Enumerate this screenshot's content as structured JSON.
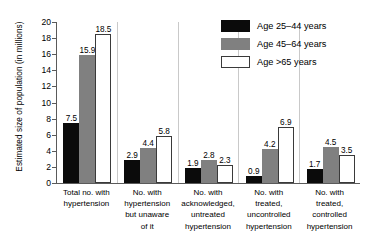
{
  "chart_data": {
    "type": "bar",
    "title": "",
    "subtitle": "",
    "xlabel": "",
    "ylabel": "Estimated size of population (in millions)",
    "ylim": [
      0,
      20
    ],
    "ytick_step": 2,
    "yticks": [
      "20",
      "18",
      "16",
      "14",
      "12",
      "10",
      "8",
      "6",
      "4",
      "2",
      "0"
    ],
    "grid": false,
    "legend_position": "top-right",
    "categories": [
      "Total no. with hypertension",
      "No. with hypertension but unaware of it",
      "No. with acknowledged, untreated hypertension",
      "No. with treated, uncontrolled hypertension",
      "No. with treated, controlled hypertension"
    ],
    "category_lines": [
      [
        "Total no. with",
        "hypertension"
      ],
      [
        "No. with",
        "hypertension",
        "but unaware",
        "of it"
      ],
      [
        "No. with",
        "acknowledged,",
        "untreated",
        "hypertension"
      ],
      [
        "No. with",
        "treated,",
        "uncontrolled",
        "hypertension"
      ],
      [
        "No. with",
        "treated,",
        "controlled",
        "hypertension"
      ]
    ],
    "series": [
      {
        "name": "Age 25–44 years",
        "color": "#0b0b0b",
        "values": [
          7.5,
          2.9,
          1.9,
          0.9,
          1.7
        ]
      },
      {
        "name": "Age 45–64 years",
        "color": "#808080",
        "values": [
          15.9,
          4.4,
          2.8,
          4.2,
          4.5
        ]
      },
      {
        "name": "Age >65 years",
        "color": "#ffffff",
        "values": [
          18.5,
          5.8,
          2.3,
          6.9,
          3.5
        ]
      }
    ],
    "value_labels": [
      [
        "7.5",
        "15.9",
        "18.5"
      ],
      [
        "2.9",
        "4.4",
        "5.8"
      ],
      [
        "1.9",
        "2.8",
        "2.3"
      ],
      [
        "0.9",
        "4.2",
        "6.9"
      ],
      [
        "1.7",
        "4.5",
        "3.5"
      ]
    ]
  },
  "legend": {
    "items": [
      {
        "label": "Age 25–44 years",
        "swatch": "black"
      },
      {
        "label": "Age 45–64 years",
        "swatch": "gray"
      },
      {
        "label": "Age >65 years",
        "swatch": "white"
      }
    ]
  }
}
